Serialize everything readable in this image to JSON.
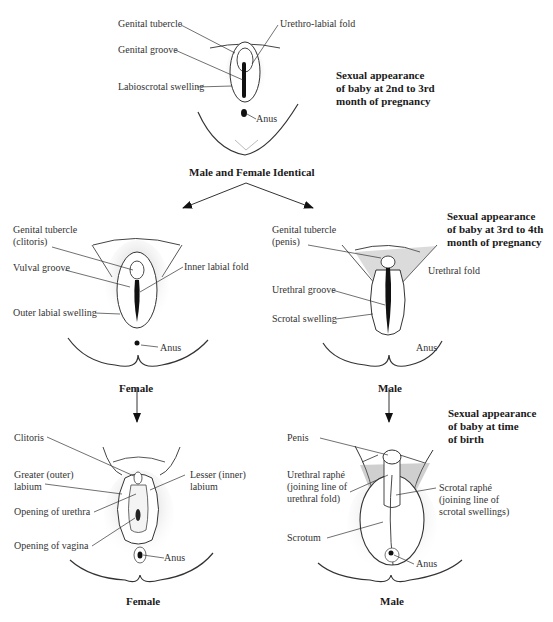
{
  "stage1": {
    "heading": [
      "Sexual appearance",
      "of baby at 2nd to 3rd",
      "month of pregnancy"
    ],
    "labels": {
      "genital_tubercle": "Genital tubercle",
      "urethro_labial_fold": "Urethro-labial fold",
      "genital_groove": "Genital groove",
      "labioscrotal_swelling": "Labioscrotal swelling",
      "anus": "Anus"
    },
    "caption": "Male and Female Identical"
  },
  "stage2": {
    "heading": [
      "Sexual appearance",
      "of baby at 3rd to 4th",
      "month of pregnancy"
    ],
    "female": {
      "labels": {
        "genital_tubercle": [
          "Genital tubercle",
          "(clitoris)"
        ],
        "vulval_groove": "Vulval groove",
        "inner_labial_fold": "Inner labial fold",
        "outer_labial_swelling": "Outer labial swelling",
        "anus": "Anus"
      },
      "caption": "Female"
    },
    "male": {
      "labels": {
        "genital_tubercle": [
          "Genital tubercle",
          "(penis)"
        ],
        "urethral_fold": "Urethral fold",
        "urethral_groove": "Urethral groove",
        "scrotal_swelling": "Scrotal swelling",
        "anus": "Anus"
      },
      "caption": "Male"
    }
  },
  "stage3": {
    "heading": [
      "Sexual appearance",
      "of baby at time",
      "of birth"
    ],
    "female": {
      "labels": {
        "clitoris": "Clitoris",
        "greater_labium": [
          "Greater (outer)",
          "labium"
        ],
        "lesser_labium": [
          "Lesser (inner)",
          "labium"
        ],
        "opening_urethra": "Opening of urethra",
        "opening_vagina": "Opening of vagina",
        "anus": "Anus"
      },
      "caption": "Female"
    },
    "male": {
      "labels": {
        "penis": "Penis",
        "urethral_raphe": [
          "Urethral raphé",
          "(joining line of",
          "urethral fold)"
        ],
        "scrotal_raphe": [
          "Scrotal raphé",
          "(joining line of",
          "scrotal swellings)"
        ],
        "scrotum": "Scrotum",
        "anus": "Anus"
      },
      "caption": "Male"
    }
  }
}
